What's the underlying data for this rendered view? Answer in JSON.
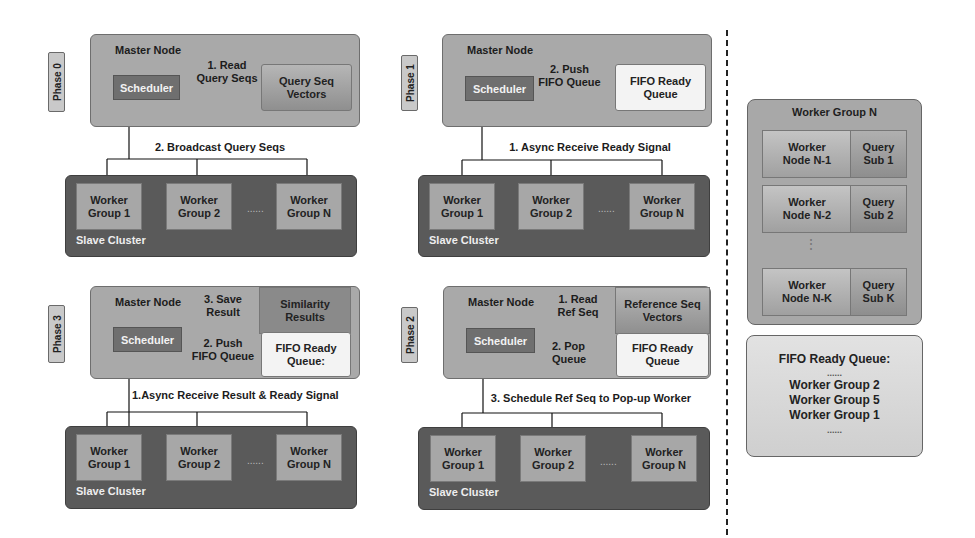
{
  "phases": [
    {
      "id": "phase0",
      "tag": "Phase 0",
      "master_label": "Master Node",
      "scheduler": "Scheduler",
      "stores": [
        {
          "label": "Query Seq\nVectors",
          "type": "vector"
        }
      ],
      "edge_labels": [
        "1. Read\nQuery Seqs",
        "2. Broadcast Query Seqs"
      ],
      "cluster_label": "Slave Cluster",
      "worker_groups": [
        "Worker\nGroup 1",
        "Worker\nGroup 2",
        "Worker\nGroup N"
      ],
      "ellipsis": "......"
    },
    {
      "id": "phase1",
      "tag": "Phase 1",
      "master_label": "Master Node",
      "scheduler": "Scheduler",
      "stores": [
        {
          "label": "FIFO Ready\nQueue",
          "type": "fifo"
        }
      ],
      "edge_labels": [
        "2. Push\nFIFO Queue",
        "1. Async Receive Ready Signal"
      ],
      "cluster_label": "Slave Cluster",
      "worker_groups": [
        "Worker\nGroup 1",
        "Worker\nGroup 2",
        "Worker\nGroup N"
      ],
      "ellipsis": "......"
    },
    {
      "id": "phase3",
      "tag": "Phase 3",
      "master_label": "Master Node",
      "scheduler": "Scheduler",
      "stores": [
        {
          "label": "Similarity\nResults",
          "type": "similarity"
        },
        {
          "label": "FIFO Ready\nQueue:",
          "type": "fifo"
        }
      ],
      "edge_labels": [
        "3. Save\nResult",
        "2. Push\nFIFO Queue",
        "1.Async Receive Result & Ready Signal"
      ],
      "cluster_label": "Slave Cluster",
      "worker_groups": [
        "Worker\nGroup 1",
        "Worker\nGroup 2",
        "Worker\nGroup N"
      ],
      "ellipsis": "......"
    },
    {
      "id": "phase2",
      "tag": "Phase 2",
      "master_label": "Master Node",
      "scheduler": "Scheduler",
      "stores": [
        {
          "label": "Reference Seq\nVectors",
          "type": "vector"
        },
        {
          "label": "FIFO Ready\nQueue",
          "type": "fifo"
        }
      ],
      "edge_labels": [
        "1. Read\nRef Seq",
        "2. Pop\nQueue",
        "3. Schedule Ref Seq to Pop-up Worker"
      ],
      "cluster_label": "Slave Cluster",
      "worker_groups": [
        "Worker\nGroup 1",
        "Worker\nGroup 2",
        "Worker\nGroup N"
      ],
      "ellipsis": "......"
    }
  ],
  "worker_group_detail": {
    "title": "Worker Group N",
    "rows": [
      {
        "node": "Worker\nNode N-1",
        "sub": "Query\nSub 1"
      },
      {
        "node": "Worker\nNode N-2",
        "sub": "Query\nSub 2"
      },
      {
        "node": "Worker\nNode N-K",
        "sub": "Query\nSub K"
      }
    ],
    "vertical_ellipsis": "⋮"
  },
  "fifo_queue_example": {
    "title": "FIFO Ready Queue:",
    "top_ellipsis": "......",
    "items": [
      "Worker Group 2",
      "Worker Group 5",
      "Worker Group 1"
    ],
    "bottom_ellipsis": "......"
  },
  "colors": {
    "master_bg": "#a9a9a9",
    "scheduler_bg": "#6f6f6f",
    "cluster_bg": "#5a5a5a",
    "worker_bg": "#a7a7a7",
    "fifo_bg": "#f3f3f3",
    "similarity_bg": "#8a8a8a"
  }
}
